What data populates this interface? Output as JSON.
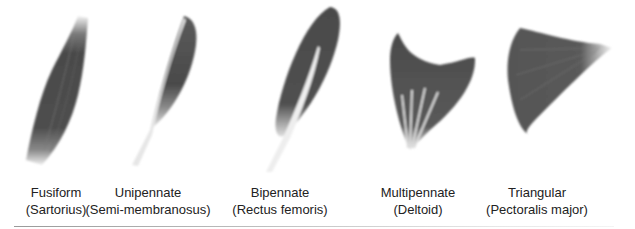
{
  "diagram": {
    "muscles": [
      {
        "id": "fusiform",
        "name": "Fusiform",
        "example": "(Sartorius)",
        "label_x": 56
      },
      {
        "id": "unipennate",
        "name": "Unipennate",
        "example": "(Semi-membranosus)",
        "label_x": 148
      },
      {
        "id": "bipennate",
        "name": "Bipennate",
        "example": "(Rectus femoris)",
        "label_x": 278
      },
      {
        "id": "multipennate",
        "name": "Multipennate",
        "example": "(Deltoid)",
        "label_x": 418
      },
      {
        "id": "triangular",
        "name": "Triangular",
        "example": "(Pectoralis major)",
        "label_x": 537
      }
    ],
    "colors": {
      "muscle": "#4a4a4a",
      "tendon": "#e8e8e8",
      "text": "#222222",
      "rule": "#a0a0a0"
    }
  }
}
